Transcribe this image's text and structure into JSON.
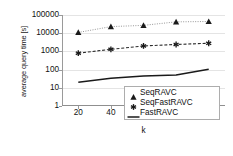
{
  "chart_data": {
    "type": "line",
    "title": "",
    "xlabel": "k",
    "ylabel": "average query time [s]",
    "x": [
      20,
      40,
      60,
      80,
      100
    ],
    "xticklabels": [
      "20",
      "40",
      "60",
      "80",
      "100"
    ],
    "xlim": [
      10,
      110
    ],
    "yscale": "log",
    "ylim": [
      1,
      100000
    ],
    "yticks": [
      1,
      10,
      100,
      1000,
      10000,
      100000
    ],
    "yticklabels": [
      "100000",
      "10000",
      "1000",
      "100",
      "10",
      "1"
    ],
    "grid": "horizontal",
    "legend_position": "lower-right-inside",
    "series": [
      {
        "name": "SeqRAVC",
        "marker": "triangle",
        "linestyle": "dotted",
        "color": "#8c8c8c",
        "marker_color": "#1a1a1a",
        "values": [
          11000,
          23000,
          27000,
          42000,
          44000
        ]
      },
      {
        "name": "SeqFastRAVC",
        "marker": "asterisk",
        "linestyle": "dashed",
        "color": "#2b2b2b",
        "marker_color": "#1a1a1a",
        "values": [
          800,
          1300,
          2000,
          2400,
          2800
        ]
      },
      {
        "name": "FastRAVC",
        "marker": "none",
        "linestyle": "solid",
        "color": "#1a1a1a",
        "marker_color": "#1a1a1a",
        "values": [
          20,
          33,
          45,
          50,
          105
        ]
      }
    ]
  },
  "legend": {
    "items": [
      {
        "label": "SeqRAVC"
      },
      {
        "label": "SeqFastRAVC"
      },
      {
        "label": "FastRAVC"
      }
    ]
  }
}
